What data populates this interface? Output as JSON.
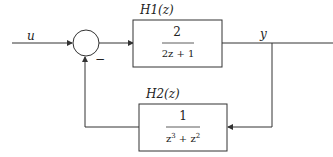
{
  "diagram": {
    "type": "feedback block diagram",
    "input_label": "u",
    "output_label": "y",
    "summing_junction": {
      "feedback_sign": "−"
    },
    "blocks": [
      {
        "id": "H1",
        "name": "H1(z)",
        "numerator": "2",
        "denominator": "2z + 1",
        "path": "forward"
      },
      {
        "id": "H2",
        "name": "H2(z)",
        "numerator": "1",
        "denominator_base": "z",
        "denominator_exp1": "3",
        "denominator_plus": " + ",
        "denominator_exp2": "2",
        "path": "feedback"
      }
    ],
    "colors": {
      "line": "#333333",
      "background": "#ffffff"
    }
  }
}
